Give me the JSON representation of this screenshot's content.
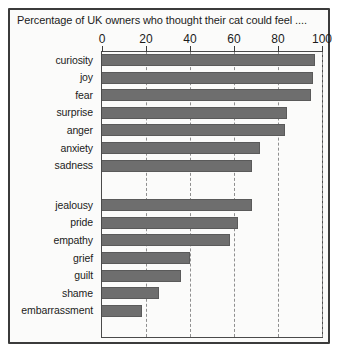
{
  "chart_data": {
    "type": "bar",
    "orientation": "horizontal",
    "title": "Percentage of UK owners who thought their cat could feel ....",
    "xlabel": "",
    "ylabel": "",
    "xlim": [
      0,
      100
    ],
    "xticks": [
      0,
      20,
      40,
      60,
      80,
      100
    ],
    "grid": true,
    "legend": "none",
    "bar_color": "#6e6e6e",
    "categories": [
      "curiosity",
      "joy",
      "fear",
      "surprise",
      "anger",
      "anxiety",
      "sadness",
      "jealousy",
      "pride",
      "empathy",
      "grief",
      "guilt",
      "shame",
      "embarrassment"
    ],
    "values": [
      97,
      96,
      95,
      84,
      83,
      72,
      68,
      68,
      62,
      58,
      40,
      36,
      26,
      18
    ],
    "groups": [
      {
        "name": "ordinary emotions",
        "categories": [
          "curiosity",
          "joy",
          "fear",
          "surprise",
          "anger",
          "anxiety",
          "sadness"
        ],
        "values": [
          97,
          96,
          95,
          84,
          83,
          72,
          68
        ]
      },
      {
        "name": "complex emotions",
        "categories": [
          "jealousy",
          "pride",
          "empathy",
          "grief",
          "guilt",
          "shame",
          "embarrassment"
        ],
        "values": [
          68,
          62,
          58,
          40,
          36,
          26,
          18
        ]
      }
    ]
  }
}
